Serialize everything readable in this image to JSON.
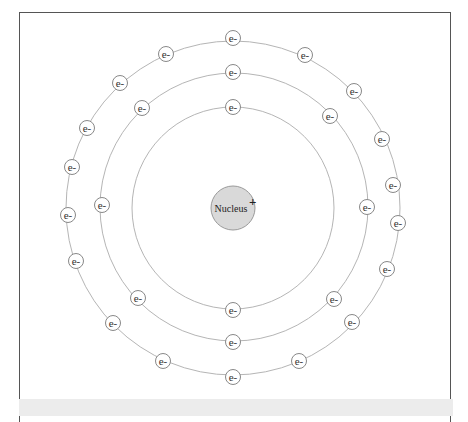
{
  "diagram": {
    "nucleus": {
      "label": "Nucleus",
      "charge": "+",
      "cx": 233,
      "cy": 208,
      "r": 22,
      "fill": "#d9d9d9",
      "stroke": "#9a9a9a"
    },
    "electron_label": "e-",
    "electron_radius": 7.5,
    "orbit_color": "#b5b5b5",
    "electron_stroke": "#888888",
    "shells": [
      {
        "name": "shell-1",
        "cx": 233,
        "cy": 208,
        "r": 101,
        "count": 2,
        "electrons": [
          [
            233,
            107
          ],
          [
            233,
            310
          ]
        ]
      },
      {
        "name": "shell-2",
        "cx": 234,
        "cy": 207,
        "r": 134,
        "count": 8,
        "electrons": [
          [
            233,
            72
          ],
          [
            330,
            116
          ],
          [
            367,
            207
          ],
          [
            334,
            299
          ],
          [
            233,
            342
          ],
          [
            138,
            298
          ],
          [
            102,
            205
          ],
          [
            142,
            108
          ]
        ]
      },
      {
        "name": "shell-3",
        "cx": 233,
        "cy": 208,
        "r": 167,
        "count": 18,
        "electrons": [
          [
            233,
            38
          ],
          [
            305,
            55
          ],
          [
            354,
            91
          ],
          [
            382,
            139
          ],
          [
            393,
            185
          ],
          [
            398,
            223
          ],
          [
            387,
            269
          ],
          [
            352,
            322
          ],
          [
            299,
            361
          ],
          [
            233,
            377
          ],
          [
            163,
            361
          ],
          [
            113,
            323
          ],
          [
            76,
            261
          ],
          [
            68,
            215
          ],
          [
            72,
            167
          ],
          [
            87,
            128
          ],
          [
            120,
            83
          ],
          [
            166,
            54
          ]
        ]
      }
    ]
  }
}
